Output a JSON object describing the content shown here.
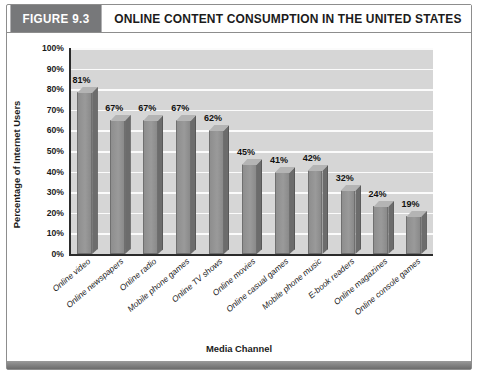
{
  "figure": {
    "tag_label": "FIGURE 9.3",
    "title": "ONLINE CONTENT CONSUMPTION IN THE UNITED STATES",
    "tag_bg_color": "#77787a",
    "frame_border_color": "#8d8d8d",
    "footer_color": "#7e7e7e"
  },
  "chart_data": {
    "type": "bar",
    "title": "ONLINE CONTENT CONSUMPTION IN THE UNITED STATES",
    "xlabel": "Media Channel",
    "ylabel": "Percentage of Internet Users",
    "ylim": [
      0,
      100
    ],
    "ytick_step": 10,
    "ytick_labels": [
      "0%",
      "10%",
      "20%",
      "30%",
      "40%",
      "50%",
      "60%",
      "70%",
      "80%",
      "90%",
      "100%"
    ],
    "grid": true,
    "legend": false,
    "bar_color": "#9a9a9a",
    "plot_bg_color": "#d6d6d6",
    "categories": [
      "Online video",
      "Online newspapers",
      "Online radio",
      "Mobile phone games",
      "Online TV shows",
      "Online movies",
      "Online casual games",
      "Mobile phone music",
      "E-book readers",
      "Online magazines",
      "Online console games"
    ],
    "values": [
      81,
      67,
      67,
      67,
      62,
      45,
      41,
      42,
      32,
      24,
      19
    ],
    "data_labels": [
      "81%",
      "67%",
      "67%",
      "67%",
      "62%",
      "45%",
      "41%",
      "42%",
      "32%",
      "24%",
      "19%"
    ]
  }
}
